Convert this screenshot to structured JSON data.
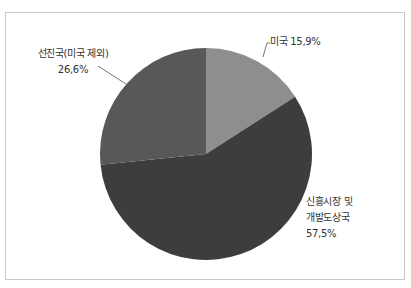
{
  "chart_data": {
    "type": "pie",
    "title": "",
    "slices": [
      {
        "label": "미국",
        "value": 15.9,
        "display": "미국 15,9%",
        "color": "#8e8e8e"
      },
      {
        "label": "신흥시장 및 개발도상국",
        "value": 57.5,
        "display_lines": [
          "신흥시장 및",
          "개발도상국",
          "57,5%"
        ],
        "color": "#3d3d3d"
      },
      {
        "label": "선진국(미국 제외)",
        "value": 26.6,
        "display_lines": [
          "선진국(미국 제외)",
          "26,6%"
        ],
        "color": "#585858"
      }
    ],
    "start_angle_deg": 0,
    "direction": "clockwise",
    "legend": "none",
    "data_labels": "outside with leader lines"
  },
  "labels": {
    "us": "미국 15,9%",
    "em_line1": "신흥시장 및",
    "em_line2": "개발도상국",
    "em_line3": "57,5%",
    "adv_line1": "선진국(미국 제외)",
    "adv_line2": "26,6%"
  }
}
